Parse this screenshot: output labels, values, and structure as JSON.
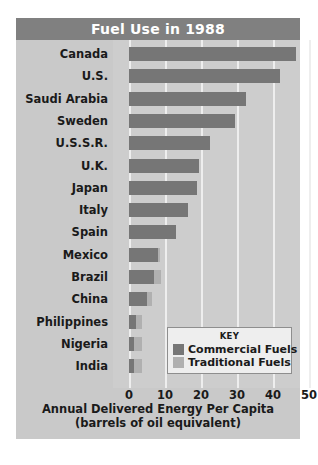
{
  "chart_data": {
    "type": "bar",
    "orientation": "horizontal",
    "stacked": true,
    "title": "Fuel Use in 1988",
    "xlabel_line1": "Annual Delivered Energy Per Capita",
    "xlabel_line2": "(barrels of oil equivalent)",
    "ylabel": "",
    "xlim": [
      0,
      50
    ],
    "xticks": [
      0,
      10,
      20,
      30,
      40,
      50
    ],
    "xtick_labels": [
      "0",
      "10",
      "20",
      "30",
      "40",
      "50"
    ],
    "grid": true,
    "legend_position": "inside-lower-right",
    "categories": [
      "Canada",
      "U.S.",
      "Saudi Arabia",
      "Sweden",
      "U.S.S.R.",
      "U.K.",
      "Japan",
      "Italy",
      "Spain",
      "Mexico",
      "Brazil",
      "China",
      "Philippines",
      "Nigeria",
      "India"
    ],
    "series": [
      {
        "name": "Commercial Fuels",
        "color": "#767676",
        "values": [
          46.5,
          42.0,
          32.5,
          29.5,
          22.5,
          19.5,
          19.0,
          16.5,
          13.0,
          8.0,
          7.0,
          5.0,
          2.0,
          1.5,
          1.5
        ]
      },
      {
        "name": "Traditional Fuels",
        "color": "#b0b0b0",
        "values": [
          0,
          0,
          0,
          0,
          0,
          0,
          0,
          0,
          0,
          0.7,
          2.0,
          1.5,
          1.5,
          2.0,
          2.0
        ]
      }
    ],
    "totals": [
      46.5,
      42.0,
      32.5,
      29.5,
      22.5,
      19.5,
      19.0,
      16.5,
      13.0,
      8.7,
      9.0,
      6.5,
      3.5,
      3.5,
      3.5
    ]
  },
  "legend": {
    "title": "KEY",
    "items": [
      {
        "label": "Commercial Fuels",
        "color": "#767676"
      },
      {
        "label": "Traditional Fuels",
        "color": "#b0b0b0"
      }
    ]
  },
  "colors": {
    "title_banner": "#808080",
    "title_text": "#ffffff",
    "figure_background": "#c9c9c9",
    "plot_background": "#cdcdcd",
    "gridline": "#eeeeee",
    "commercial": "#767676",
    "traditional": "#b0b0b0",
    "text": "#1a1a1a",
    "legend_background": "#eeeeee",
    "legend_border": "#8e8e8e"
  }
}
